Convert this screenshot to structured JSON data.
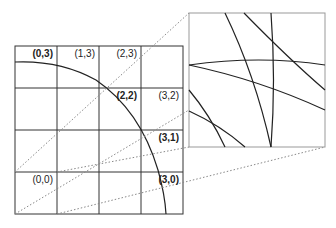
{
  "diagram": {
    "grid": {
      "rows": 4,
      "cols": 4,
      "labels": [
        {
          "text": "(0,3)",
          "col": 0,
          "row": 3,
          "bold": true
        },
        {
          "text": "(1,3)",
          "col": 1,
          "row": 3,
          "bold": false
        },
        {
          "text": "(2,3)",
          "col": 2,
          "row": 3,
          "bold": false
        },
        {
          "text": "(2,2)",
          "col": 2,
          "row": 2,
          "bold": true
        },
        {
          "text": "(3,2)",
          "col": 3,
          "row": 2,
          "bold": false
        },
        {
          "text": "(3,1)",
          "col": 3,
          "row": 1,
          "bold": true
        },
        {
          "text": "(0,0)",
          "col": 0,
          "row": 0,
          "bold": false
        },
        {
          "text": "(3,0)",
          "col": 3,
          "row": 0,
          "bold": true
        }
      ]
    },
    "arc": {
      "description": "quarter circle arc crossing bold-labelled cells"
    },
    "inset": {
      "description": "magnified view of intersecting arcs"
    },
    "colors": {
      "line": "#333333",
      "dotted": "#888888",
      "grid": "#333333"
    }
  }
}
